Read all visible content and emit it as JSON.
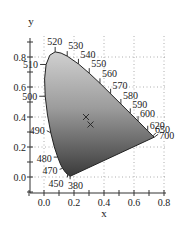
{
  "chart_data": {
    "type": "scatter",
    "xlabel": "x",
    "ylabel": "y",
    "xlim": [
      -0.1,
      0.8
    ],
    "ylim": [
      -0.1,
      0.9
    ],
    "grid": true,
    "x_ticks": [
      "0.0",
      "0.2",
      "0.4",
      "0.6",
      "0.8"
    ],
    "y_ticks": [
      "0.0",
      "0.2",
      "0.4",
      "0.6",
      "0.8"
    ],
    "spectral_locus": [
      {
        "nm": 380,
        "x": 0.1741,
        "y": 0.005
      },
      {
        "nm": 450,
        "x": 0.1566,
        "y": 0.0177
      },
      {
        "nm": 460,
        "x": 0.144,
        "y": 0.0297
      },
      {
        "nm": 470,
        "x": 0.1241,
        "y": 0.0578
      },
      {
        "nm": 475,
        "x": 0.1096,
        "y": 0.0868
      },
      {
        "nm": 480,
        "x": 0.0913,
        "y": 0.1327
      },
      {
        "nm": 485,
        "x": 0.0687,
        "y": 0.2007
      },
      {
        "nm": 490,
        "x": 0.0454,
        "y": 0.295
      },
      {
        "nm": 495,
        "x": 0.0235,
        "y": 0.4127
      },
      {
        "nm": 500,
        "x": 0.0082,
        "y": 0.5384
      },
      {
        "nm": 505,
        "x": 0.0039,
        "y": 0.6548
      },
      {
        "nm": 510,
        "x": 0.0139,
        "y": 0.7502
      },
      {
        "nm": 515,
        "x": 0.0389,
        "y": 0.812
      },
      {
        "nm": 520,
        "x": 0.0743,
        "y": 0.8338
      },
      {
        "nm": 525,
        "x": 0.1142,
        "y": 0.8262
      },
      {
        "nm": 530,
        "x": 0.1547,
        "y": 0.8059
      },
      {
        "nm": 540,
        "x": 0.2296,
        "y": 0.7543
      },
      {
        "nm": 550,
        "x": 0.3016,
        "y": 0.6923
      },
      {
        "nm": 560,
        "x": 0.3731,
        "y": 0.6245
      },
      {
        "nm": 570,
        "x": 0.4441,
        "y": 0.5547
      },
      {
        "nm": 580,
        "x": 0.5125,
        "y": 0.4866
      },
      {
        "nm": 590,
        "x": 0.5752,
        "y": 0.4242
      },
      {
        "nm": 600,
        "x": 0.627,
        "y": 0.3725
      },
      {
        "nm": 620,
        "x": 0.6915,
        "y": 0.3083
      },
      {
        "nm": 650,
        "x": 0.726,
        "y": 0.274
      },
      {
        "nm": 700,
        "x": 0.7347,
        "y": 0.2653
      }
    ],
    "wavelength_labels": [
      {
        "label": "520",
        "nm": 520,
        "side": "top"
      },
      {
        "label": "530",
        "nm": 530,
        "side": "top"
      },
      {
        "label": "540",
        "nm": 540,
        "side": "right"
      },
      {
        "label": "550",
        "nm": 550,
        "side": "right"
      },
      {
        "label": "560",
        "nm": 560,
        "side": "right"
      },
      {
        "label": "570",
        "nm": 570,
        "side": "right"
      },
      {
        "label": "580",
        "nm": 580,
        "side": "right"
      },
      {
        "label": "590",
        "nm": 590,
        "side": "right"
      },
      {
        "label": "600",
        "nm": 600,
        "side": "right"
      },
      {
        "label": "620",
        "nm": 620,
        "side": "right"
      },
      {
        "label": "650",
        "nm": 650,
        "side": "right"
      },
      {
        "label": "700",
        "nm": 700,
        "side": "right"
      },
      {
        "label": "510",
        "nm": 510,
        "side": "left"
      },
      {
        "label": "500",
        "nm": 500,
        "side": "left"
      },
      {
        "label": "490",
        "nm": 490,
        "side": "left"
      },
      {
        "label": "480",
        "nm": 480,
        "side": "left"
      },
      {
        "label": "470",
        "nm": 470,
        "side": "left"
      },
      {
        "label": "450",
        "nm": 450,
        "side": "bottom"
      },
      {
        "label": "380",
        "nm": 380,
        "side": "bottom"
      }
    ],
    "markers": [
      {
        "symbol": "x",
        "x": 0.28,
        "y": 0.4
      },
      {
        "symbol": "x",
        "x": 0.31,
        "y": 0.35
      }
    ],
    "fill": "gray gradient (light at top, dark at bottom)"
  }
}
